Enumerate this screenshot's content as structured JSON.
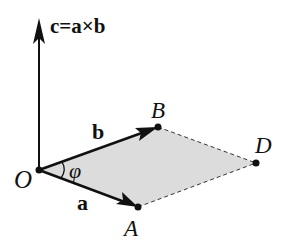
{
  "diagram": {
    "title_label": "c=a×b",
    "points": {
      "O": {
        "label": "O",
        "x": 39,
        "y": 170
      },
      "A": {
        "label": "A",
        "x": 138,
        "y": 207
      },
      "B": {
        "label": "B",
        "x": 158,
        "y": 127
      },
      "D": {
        "label": "D",
        "x": 256,
        "y": 163
      }
    },
    "vectors": {
      "a": {
        "label": "a",
        "from": "O",
        "to": "A"
      },
      "b": {
        "label": "b",
        "from": "O",
        "to": "B"
      },
      "c": {
        "label": "c=a×b",
        "from": "O",
        "to_top_y": 22
      }
    },
    "angle_label": "φ",
    "colors": {
      "stroke": "#111111",
      "fill_parallelogram": "#dcdcdc"
    }
  }
}
